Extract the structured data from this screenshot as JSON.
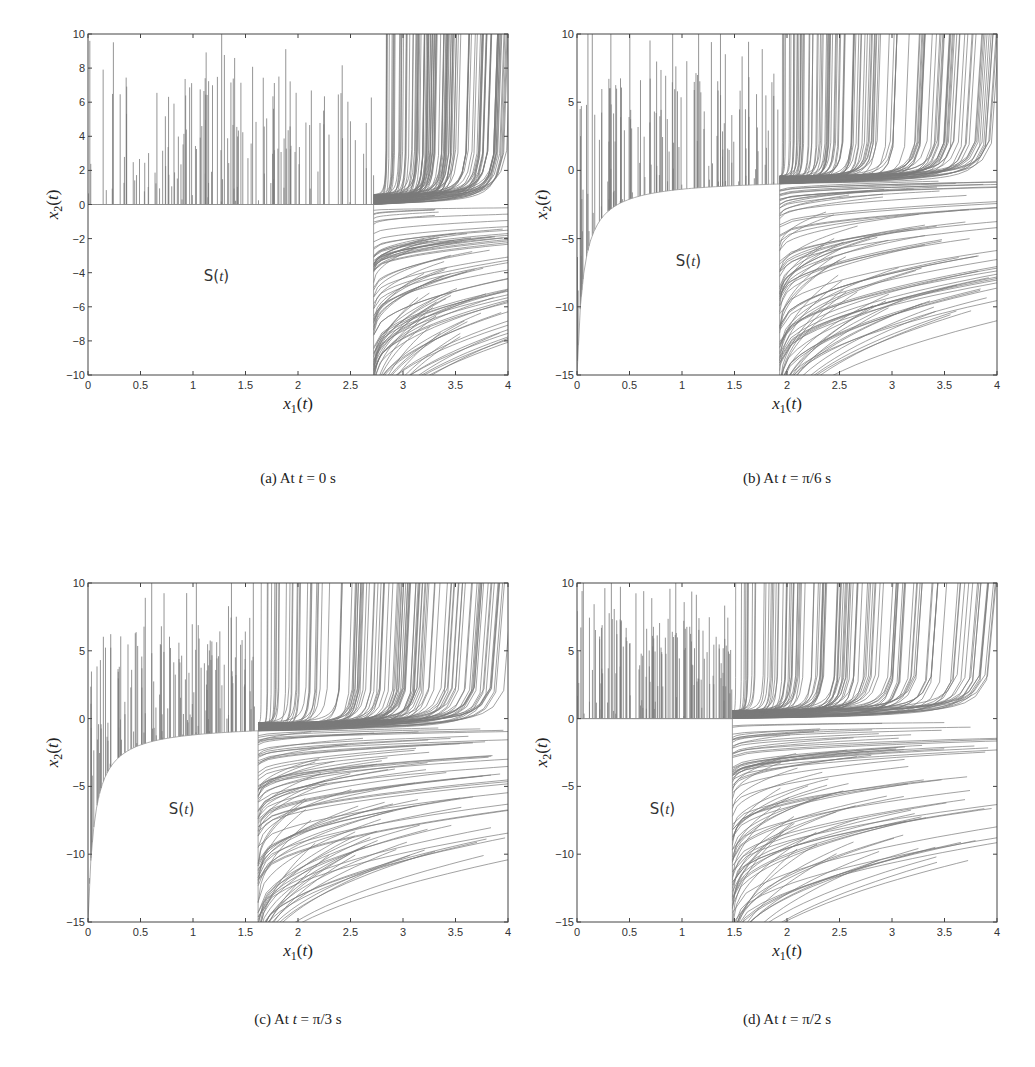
{
  "figure": {
    "panels": [
      {
        "id": "a",
        "caption": "(a) At t = 0 s",
        "caption_prefix": "(a) At ",
        "caption_var": "t",
        "caption_suffix": " = 0 s",
        "region_label": "S(t)"
      },
      {
        "id": "b",
        "caption": "(b) At t = π/6 s",
        "caption_prefix": "(b) At ",
        "caption_var": "t",
        "caption_suffix": " = π/6 s",
        "region_label": "S(t)"
      },
      {
        "id": "c",
        "caption": "(c) At t = π/3 s",
        "caption_prefix": "(c) At ",
        "caption_var": "t",
        "caption_suffix": " = π/3 s",
        "region_label": "S(t)"
      },
      {
        "id": "d",
        "caption": "(d) At t = π/2 s",
        "caption_prefix": "(d) At ",
        "caption_var": "t",
        "caption_suffix": " = π/2 s",
        "region_label": "S(t)"
      }
    ]
  },
  "chart_data": [
    {
      "type": "line",
      "title": "(a) At t = 0 s",
      "xlabel": "x1(t)",
      "ylabel": "x2(t)",
      "xlim": [
        0,
        4
      ],
      "ylim": [
        -10,
        10
      ],
      "xticks": [
        0,
        0.5,
        1,
        1.5,
        2,
        2.5,
        3,
        3.5,
        4
      ],
      "yticks": [
        -10,
        -8,
        -6,
        -4,
        -2,
        0,
        2,
        4,
        6,
        8,
        10
      ],
      "region_label": "S(t)",
      "boundary_x1": 2.72,
      "boundary_x2_top": 0,
      "description": "Trajectory families; vertical lines above x2=0 for x1<2.72, curves rising to right for x1>2.72, empty safe set S(t) in lower left"
    },
    {
      "type": "line",
      "title": "(b) At t = π/6 s",
      "xlabel": "x1(t)",
      "ylabel": "x2(t)",
      "xlim": [
        0,
        4
      ],
      "ylim": [
        -15,
        10
      ],
      "xticks": [
        0,
        0.5,
        1,
        1.5,
        2,
        2.5,
        3,
        3.5,
        4
      ],
      "yticks": [
        -15,
        -10,
        -5,
        0,
        5,
        10
      ],
      "region_label": "S(t)",
      "boundary_x1": 1.93,
      "boundary_x2_top": -1.0,
      "description": "Curved upper boundary of S(t) from (0,-15) rising to (1.93,-1)"
    },
    {
      "type": "line",
      "title": "(c) At t = π/3 s",
      "xlabel": "x1(t)",
      "ylabel": "x2(t)",
      "xlim": [
        0,
        4
      ],
      "ylim": [
        -15,
        10
      ],
      "xticks": [
        0,
        0.5,
        1,
        1.5,
        2,
        2.5,
        3,
        3.5,
        4
      ],
      "yticks": [
        -15,
        -10,
        -5,
        0,
        5,
        10
      ],
      "region_label": "S(t)",
      "boundary_x1": 1.62,
      "boundary_x2_top": -0.9,
      "description": "Curved upper boundary of S(t) from (0,-15) rising to (1.62,-0.9)"
    },
    {
      "type": "line",
      "title": "(d) At t = π/2 s",
      "xlabel": "x1(t)",
      "ylabel": "x2(t)",
      "xlim": [
        0,
        4
      ],
      "ylim": [
        -15,
        10
      ],
      "xticks": [
        0,
        0.5,
        1,
        1.5,
        2,
        2.5,
        3,
        3.5,
        4
      ],
      "yticks": [
        -15,
        -10,
        -5,
        0,
        5,
        10
      ],
      "region_label": "S(t)",
      "boundary_x1": 1.48,
      "boundary_x2_top": 0,
      "description": "Rectangular S(t) region below x2=0 for x1<1.48"
    }
  ]
}
